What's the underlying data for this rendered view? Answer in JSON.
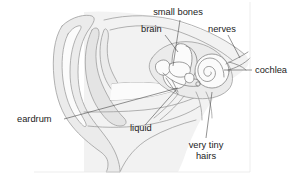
{
  "figure": {
    "background_color": "#ffffff",
    "line_color": "#9a9a9a",
    "leader_color": "#4a4a4a",
    "text_color": "#1b1b1b",
    "width": 298,
    "height": 181
  },
  "labels": {
    "small_bones": "small bones",
    "brain": "brain",
    "nerves": "nerves",
    "cochlea": "cochlea",
    "eardrum": "eardrum",
    "liquid": "liquid",
    "very_tiny_hairs_line1": "very tiny",
    "very_tiny_hairs_line2": "hairs"
  },
  "parts": [
    {
      "id": "small-bones",
      "label": "small bones",
      "label_x": 178,
      "label_y": 15,
      "anchor_x": 173,
      "anchor_y": 66
    },
    {
      "id": "brain",
      "label": "brain",
      "label_x": 141,
      "label_y": 32,
      "anchor_x": 178,
      "anchor_y": 52
    },
    {
      "id": "nerves",
      "label": "nerves",
      "label_x": 208,
      "label_y": 32,
      "anchor_x": 233,
      "anchor_y": 62
    },
    {
      "id": "cochlea",
      "label": "cochlea",
      "label_x": 255,
      "label_y": 73,
      "anchor_x": 222,
      "anchor_y": 71
    },
    {
      "id": "eardrum",
      "label": "eardrum",
      "label_x": 17,
      "label_y": 122,
      "anchor_x": 178,
      "anchor_y": 88
    },
    {
      "id": "liquid",
      "label": "liquid",
      "label_x": 130,
      "label_y": 131,
      "anchor_x": 176,
      "anchor_y": 90
    },
    {
      "id": "very-tiny-hairs",
      "label": "very tiny hairs",
      "label_x": 186,
      "label_y": 148,
      "anchor_x": 208,
      "anchor_y": 88
    }
  ]
}
